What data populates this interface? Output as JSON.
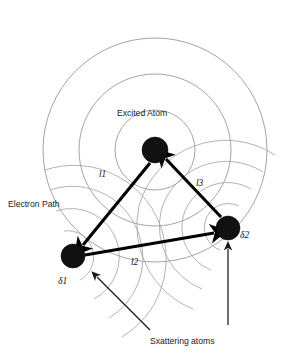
{
  "figure": {
    "background_color": "#ffffff",
    "wavefront_color": "#9a9a9a",
    "atom_color": "#111111",
    "arrow_color": "#000000"
  },
  "labels": {
    "excited_atom": "Excited Atom",
    "electron_path": "Electron Path",
    "scattering_atoms": "Sxattering atoms",
    "path_l1": "l1",
    "path_l2": "l2",
    "path_l3": "l3",
    "delta1": "δ1",
    "delta2": "δ2"
  },
  "atoms": [
    {
      "name": "excited-atom",
      "label": "Excited Atom",
      "cx": 155,
      "cy": 150,
      "r": 13
    },
    {
      "name": "scattering-atom-delta1",
      "label": "δ1",
      "cx": 73,
      "cy": 256,
      "r": 12
    },
    {
      "name": "scattering-atom-delta2",
      "label": "δ2",
      "cx": 228,
      "cy": 228,
      "r": 12
    }
  ],
  "wavefronts": {
    "primary_center": {
      "cx": 155,
      "cy": 150
    },
    "primary_radii": [
      40,
      76,
      112
    ],
    "secondary_delta1_radii": [
      26,
      48,
      70,
      92
    ],
    "secondary_delta2_radii": [
      24,
      46,
      68,
      90
    ]
  },
  "paths": [
    {
      "name": "l1",
      "label": "l1",
      "from": "excited-atom",
      "to": "delta1",
      "arrowhead": "to"
    },
    {
      "name": "l2",
      "label": "l2",
      "from": "delta1",
      "to": "delta2",
      "arrowhead": "to"
    },
    {
      "name": "l3",
      "label": "l3",
      "from": "delta2",
      "to": "excited-atom",
      "arrowhead": "to"
    }
  ],
  "annotations": [
    {
      "name": "pointer-to-delta1",
      "target": "δ1 scattering atom",
      "direction": "up-left"
    },
    {
      "name": "pointer-to-delta2",
      "target": "δ2 scattering atom",
      "direction": "up"
    }
  ]
}
